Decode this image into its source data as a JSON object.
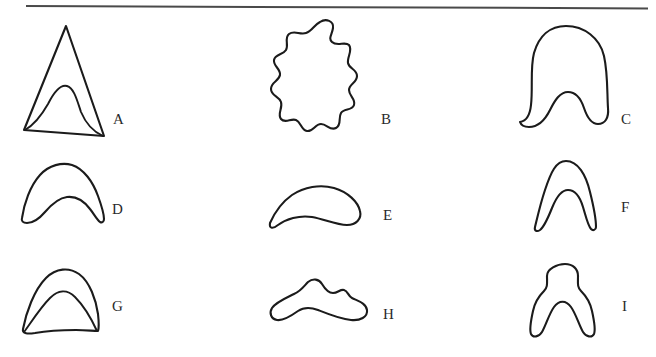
{
  "plate": {
    "title": "Shape outline plate",
    "background_color": "#ffffff",
    "ink_color": "#1b1b1b",
    "rule_color": "#4a4a4a",
    "width": 656,
    "height": 357,
    "rows": 3,
    "columns": 3
  },
  "divider": {
    "name": "top-horizontal-rule",
    "visible": true
  },
  "figures": [
    {
      "label": "A",
      "description": "triangle with inner curved hump",
      "row": 1,
      "column": 1,
      "label_x": 113,
      "label_y": 119
    },
    {
      "label": "B",
      "description": "wavy scalloped blob",
      "row": 1,
      "column": 2,
      "label_x": 381,
      "label_y": 119
    },
    {
      "label": "C",
      "description": "bell dome with notched base",
      "row": 1,
      "column": 3,
      "label_x": 621,
      "label_y": 119
    },
    {
      "label": "D",
      "description": "arch with concave underside",
      "row": 2,
      "column": 1,
      "label_x": 112,
      "label_y": 209
    },
    {
      "label": "E",
      "description": "crescent comma form",
      "row": 2,
      "column": 2,
      "label_x": 383,
      "label_y": 215
    },
    {
      "label": "F",
      "description": "narrow inverted U with deep notch",
      "row": 2,
      "column": 3,
      "label_x": 621,
      "label_y": 207
    },
    {
      "label": "G",
      "description": "dome with inner dome",
      "row": 3,
      "column": 1,
      "label_x": 112,
      "label_y": 306
    },
    {
      "label": "H",
      "description": "low wide blob with bumps",
      "row": 3,
      "column": 2,
      "label_x": 383,
      "label_y": 314
    },
    {
      "label": "I",
      "description": "lobed inverted U with deep notch",
      "row": 3,
      "column": 3,
      "label_x": 622,
      "label_y": 306
    }
  ]
}
